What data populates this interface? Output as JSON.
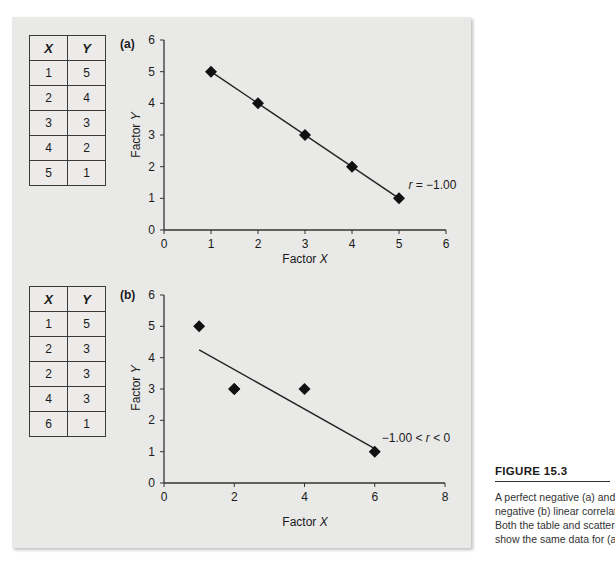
{
  "figure": {
    "label": "FIGURE 15.3",
    "caption_lines": [
      "A perfect negative (a) and a",
      "negative (b) linear correlation.",
      "Both the table and scatter plot",
      "show the same data for (a) and"
    ]
  },
  "panels": [
    {
      "id": "a",
      "panel_label": "(a)",
      "table": {
        "headers": [
          "X",
          "Y"
        ],
        "rows": [
          [
            "1",
            "5"
          ],
          [
            "2",
            "4"
          ],
          [
            "3",
            "3"
          ],
          [
            "4",
            "2"
          ],
          [
            "5",
            "1"
          ]
        ]
      },
      "annotation": "r = −1.00",
      "xlabel": "Factor X",
      "ylabel": "Factor Y"
    },
    {
      "id": "b",
      "panel_label": "(b)",
      "table": {
        "headers": [
          "X",
          "Y"
        ],
        "rows": [
          [
            "1",
            "5"
          ],
          [
            "2",
            "3"
          ],
          [
            "2",
            "3"
          ],
          [
            "4",
            "3"
          ],
          [
            "6",
            "1"
          ]
        ]
      },
      "annotation": "−1.00 < r < 0",
      "xlabel": "Factor X",
      "ylabel": "Factor Y"
    }
  ],
  "chart_data": [
    {
      "type": "scatter",
      "title": "(a)",
      "xlabel": "Factor X",
      "ylabel": "Factor Y",
      "xlim": [
        0,
        6
      ],
      "ylim": [
        0,
        6
      ],
      "xticks": [
        0,
        1,
        2,
        3,
        4,
        5,
        6
      ],
      "yticks": [
        0,
        1,
        2,
        3,
        4,
        5,
        6
      ],
      "grid": false,
      "series": [
        {
          "name": "data",
          "x": [
            1,
            2,
            3,
            4,
            5
          ],
          "y": [
            5,
            4,
            3,
            2,
            1
          ],
          "marker": "diamond"
        }
      ],
      "fit_line": {
        "x": [
          1,
          5
        ],
        "y": [
          5,
          1
        ]
      },
      "annotations": [
        {
          "text": "r = −1.00",
          "x": 5.2,
          "y": 1.3
        }
      ]
    },
    {
      "type": "scatter",
      "title": "(b)",
      "xlabel": "Factor X",
      "ylabel": "Factor Y",
      "xlim": [
        0,
        8
      ],
      "ylim": [
        0,
        6
      ],
      "xticks": [
        0,
        2,
        4,
        6,
        8
      ],
      "yticks": [
        0,
        1,
        2,
        3,
        4,
        5,
        6
      ],
      "grid": false,
      "series": [
        {
          "name": "data",
          "x": [
            1,
            2,
            2,
            4,
            6
          ],
          "y": [
            5,
            3,
            3,
            3,
            1
          ],
          "marker": "diamond"
        }
      ],
      "fit_line": {
        "x": [
          1,
          6
        ],
        "y": [
          4.25,
          1.1
        ]
      },
      "annotations": [
        {
          "text": "−1.00 < r < 0",
          "x": 6.2,
          "y": 1.3
        }
      ]
    }
  ]
}
